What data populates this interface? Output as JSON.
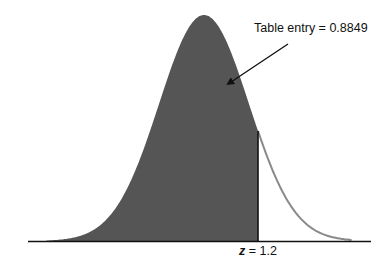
{
  "chart_data": {
    "type": "area",
    "title": "",
    "subtitle": "",
    "xlabel": "",
    "ylabel": "",
    "distribution": "standard normal",
    "mean": 0,
    "sd": 1,
    "shaded_region": {
      "from": "-inf",
      "to": 1.2
    },
    "cutoff": {
      "variable": "z",
      "value": 1.2,
      "label": "z = 1.2"
    },
    "annotation": {
      "text": "Table entry = 0.8849",
      "value": 0.8849,
      "arrow_points_to": "shaded area"
    },
    "x_range": [
      -3.5,
      3.5
    ],
    "grid": false,
    "legend": "none",
    "colors": {
      "shaded_fill": "#555555",
      "curve_unshaded": "#8a8a8a",
      "axis": "#111111",
      "cutoff_line": "#111111"
    }
  },
  "labels": {
    "entry_text": "Table entry = 0.8849",
    "z_var": "z",
    "z_eq": " = 1.2"
  }
}
